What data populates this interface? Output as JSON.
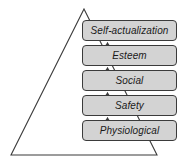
{
  "diagram": {
    "type": "maslow-hierarchy-of-needs",
    "shape": "triangle-with-stacked-levels",
    "colors": {
      "box_fill": "#d3d3d3",
      "box_border": "#3b3b3b",
      "triangle_stroke": "#3b3b3b",
      "text": "#1a1a1a",
      "background": "#ffffff"
    },
    "triangle": {
      "apex": [
        84,
        9
      ],
      "bottom_left": [
        11,
        155
      ],
      "bottom_right": [
        157,
        155
      ]
    },
    "levels": [
      {
        "label": "Self-actualization",
        "rank": 5,
        "top": 20
      },
      {
        "label": "Esteem",
        "rank": 4,
        "top": 45
      },
      {
        "label": "Social",
        "rank": 3,
        "top": 70
      },
      {
        "label": "Safety",
        "rank": 2,
        "top": 95
      },
      {
        "label": "Physiological",
        "rank": 1,
        "top": 120
      }
    ],
    "connectors": [
      {
        "from": "Esteem",
        "to": "Self-actualization",
        "direction": "up"
      },
      {
        "from": "Social",
        "to": "Esteem",
        "direction": "up"
      },
      {
        "from": "Safety",
        "to": "Social",
        "direction": "up"
      },
      {
        "from": "Physiological",
        "to": "Safety",
        "direction": "up"
      }
    ]
  }
}
